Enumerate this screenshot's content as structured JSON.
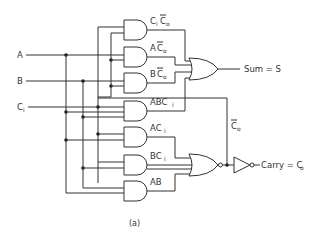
{
  "diagram": {
    "caption": "(a)",
    "inputs": [
      {
        "name": "A",
        "label": "A"
      },
      {
        "name": "B",
        "label": "B"
      },
      {
        "name": "Ci",
        "label": "C",
        "sub": "i"
      }
    ],
    "and_gates": [
      {
        "label": "C",
        "sub": "i",
        "rest": "C",
        "rest_sub": "o",
        "bar_on_rest": true,
        "text": "CiC̄o"
      },
      {
        "label": "A",
        "rest": "C",
        "rest_sub": "o",
        "bar_on_rest": true,
        "text": "AC̄o"
      },
      {
        "label": "B",
        "rest": "C",
        "rest_sub": "o",
        "bar_on_rest": true,
        "text": "BC̄o"
      },
      {
        "label": "ABC",
        "sub": "i",
        "text": "ABCi"
      },
      {
        "label": "AC",
        "sub": "i",
        "text": "ACi"
      },
      {
        "label": "BC",
        "sub": "i",
        "text": "BCi"
      },
      {
        "label": "AB",
        "text": "AB"
      }
    ],
    "or_gate": {
      "output_label": "Sum = S"
    },
    "nor_gate": {
      "output_label": "C̄o",
      "out_main": "C",
      "out_sub": "o"
    },
    "inverter": {
      "output_label": "Carry = Co",
      "out_prefix": "Carry = C",
      "out_sub": "o"
    },
    "outputs": {
      "sum": "Sum = S",
      "carry": "Carry = C",
      "carry_sub": "o",
      "co_bar": "C",
      "co_bar_sub": "o"
    }
  }
}
